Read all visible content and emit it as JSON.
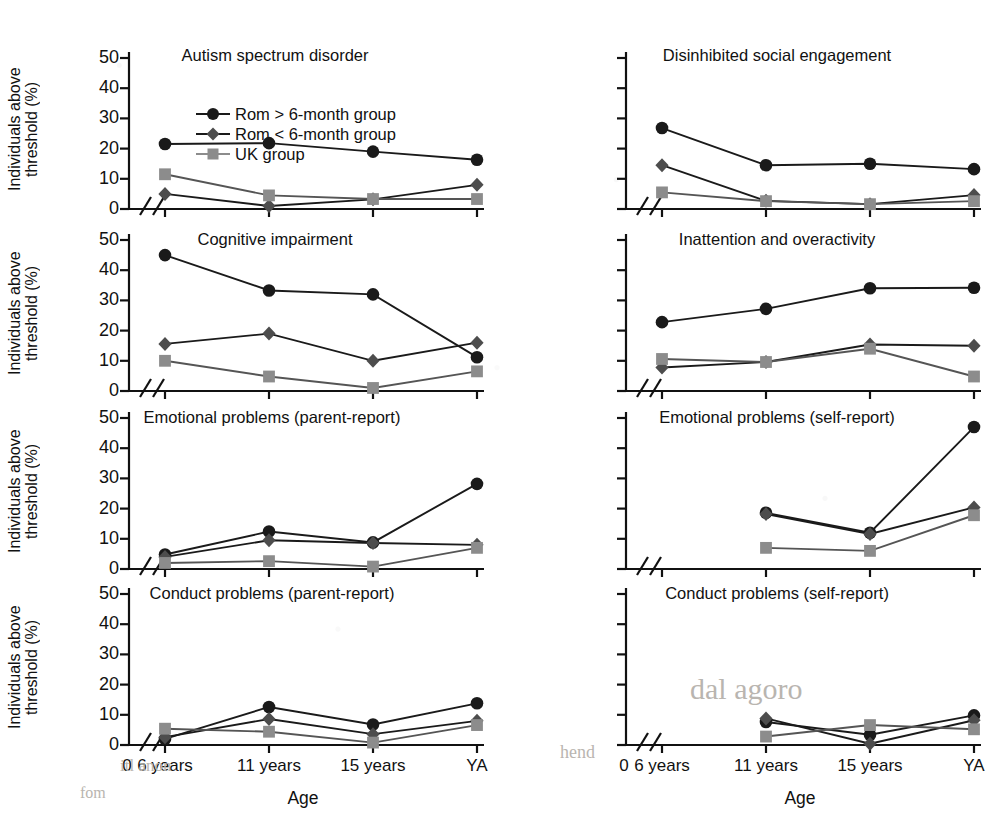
{
  "figure": {
    "x_axis_label": "Age",
    "y_axis_label": "Individuals above\nthreshold (%)",
    "y_axis_label_line1": "Individuals above",
    "y_axis_label_line2": "threshold (%)",
    "y_ticks": [
      "0",
      "10",
      "20",
      "30",
      "40",
      "50"
    ],
    "y_tick_values": [
      0,
      10,
      20,
      30,
      40,
      50
    ],
    "x_origin_label": "0",
    "x_ticks": [
      "6 years",
      "11 years",
      "15 years",
      "YA"
    ],
    "axis_break": true
  },
  "legend": {
    "position": "top-left-panel-inside",
    "entries": [
      {
        "label": "Rom > 6-month group",
        "marker": "circle",
        "color": "#1a1a1a"
      },
      {
        "label": "Rom < 6-month group",
        "marker": "diamond",
        "color": "#4d4d4d"
      },
      {
        "label": "UK group",
        "marker": "square",
        "color": "#8c8c8c"
      }
    ]
  },
  "colors": {
    "rom_over6": "#1a1a1a",
    "rom_under6": "#4d4d4d",
    "uk": "#8c8c8c",
    "axis": "#111111"
  },
  "chart_data": [
    {
      "type": "line",
      "title": "Autism spectrum disorder",
      "xlabel": "Age",
      "ylabel": "Individuals above threshold (%)",
      "categories": [
        "6 years",
        "11 years",
        "15 years",
        "YA"
      ],
      "ylim": [
        0,
        50
      ],
      "grid": false,
      "legend": "inside-top-right",
      "series": [
        {
          "name": "Rom > 6-month group",
          "values": [
            21.5,
            21.8,
            19.0,
            16.3
          ]
        },
        {
          "name": "Rom < 6-month group",
          "values": [
            5.0,
            1.0,
            3.2,
            8.0
          ]
        },
        {
          "name": "UK group",
          "values": [
            11.5,
            4.5,
            3.3,
            3.3
          ]
        }
      ]
    },
    {
      "type": "line",
      "title": "Disinhibited social engagement",
      "xlabel": "Age",
      "ylabel": "Individuals above threshold (%)",
      "categories": [
        "6 years",
        "11 years",
        "15 years",
        "YA"
      ],
      "ylim": [
        0,
        50
      ],
      "grid": false,
      "series": [
        {
          "name": "Rom > 6-month group",
          "values": [
            26.8,
            14.5,
            15.0,
            13.2
          ]
        },
        {
          "name": "Rom < 6-month group",
          "values": [
            14.5,
            2.7,
            1.6,
            4.6
          ]
        },
        {
          "name": "UK group",
          "values": [
            5.5,
            2.6,
            1.6,
            2.6
          ]
        }
      ]
    },
    {
      "type": "line",
      "title": "Cognitive impairment",
      "xlabel": "Age",
      "ylabel": "Individuals above threshold (%)",
      "categories": [
        "6 years",
        "11 years",
        "15 years",
        "YA"
      ],
      "ylim": [
        0,
        50
      ],
      "grid": false,
      "series": [
        {
          "name": "Rom > 6-month group",
          "values": [
            45.0,
            33.3,
            32.0,
            11.2
          ]
        },
        {
          "name": "Rom < 6-month group",
          "values": [
            15.6,
            19.0,
            10.0,
            16.0
          ]
        },
        {
          "name": "UK group",
          "values": [
            10.0,
            4.8,
            1.0,
            6.5
          ]
        }
      ]
    },
    {
      "type": "line",
      "title": "Inattention and overactivity",
      "xlabel": "Age",
      "ylabel": "Individuals above threshold (%)",
      "categories": [
        "6 years",
        "11 years",
        "15 years",
        "YA"
      ],
      "ylim": [
        0,
        50
      ],
      "grid": false,
      "series": [
        {
          "name": "Rom > 6-month group",
          "values": [
            22.8,
            27.2,
            34.0,
            34.2
          ]
        },
        {
          "name": "Rom < 6-month group",
          "values": [
            7.8,
            9.6,
            15.4,
            15.0
          ]
        },
        {
          "name": "UK group",
          "values": [
            10.6,
            9.6,
            14.0,
            4.8
          ]
        }
      ]
    },
    {
      "type": "line",
      "title": "Emotional problems (parent-report)",
      "xlabel": "Age",
      "ylabel": "Individuals above threshold (%)",
      "categories": [
        "6 years",
        "11 years",
        "15 years",
        "YA"
      ],
      "ylim": [
        0,
        50
      ],
      "grid": false,
      "series": [
        {
          "name": "Rom > 6-month group",
          "values": [
            4.8,
            12.4,
            8.8,
            28.2
          ]
        },
        {
          "name": "Rom < 6-month group",
          "values": [
            4.0,
            9.5,
            8.6,
            8.0
          ]
        },
        {
          "name": "UK group",
          "values": [
            2.0,
            2.6,
            0.8,
            7.0
          ]
        }
      ]
    },
    {
      "type": "line",
      "title": "Emotional problems (self-report)",
      "xlabel": "Age",
      "ylabel": "Individuals above threshold (%)",
      "categories": [
        "6 years",
        "11 years",
        "15 years",
        "YA"
      ],
      "ylim": [
        0,
        50
      ],
      "grid": false,
      "series": [
        {
          "name": "Rom > 6-month group",
          "values": [
            null,
            18.6,
            12.0,
            47.0
          ]
        },
        {
          "name": "Rom < 6-month group",
          "values": [
            null,
            18.2,
            11.6,
            20.4
          ]
        },
        {
          "name": "UK group",
          "values": [
            null,
            7.0,
            6.0,
            17.8
          ]
        }
      ]
    },
    {
      "type": "line",
      "title": "Conduct problems (parent-report)",
      "xlabel": "Age",
      "ylabel": "Individuals above threshold (%)",
      "categories": [
        "6 years",
        "11 years",
        "15 years",
        "YA"
      ],
      "ylim": [
        0,
        50
      ],
      "grid": false,
      "series": [
        {
          "name": "Rom > 6-month group",
          "values": [
            2.0,
            12.6,
            6.8,
            13.8
          ]
        },
        {
          "name": "Rom < 6-month group",
          "values": [
            2.6,
            8.6,
            3.6,
            8.0
          ]
        },
        {
          "name": "UK group",
          "values": [
            5.4,
            4.4,
            0.8,
            6.6
          ]
        }
      ]
    },
    {
      "type": "line",
      "title": "Conduct problems (self-report)",
      "xlabel": "Age",
      "ylabel": "Individuals above threshold (%)",
      "categories": [
        "6 years",
        "11 years",
        "15 years",
        "YA"
      ],
      "ylim": [
        0,
        50
      ],
      "grid": false,
      "series": [
        {
          "name": "Rom > 6-month group",
          "values": [
            null,
            7.6,
            3.4,
            9.8
          ]
        },
        {
          "name": "Rom < 6-month group",
          "values": [
            null,
            8.8,
            0.4,
            8.2
          ]
        },
        {
          "name": "UK group",
          "values": [
            null,
            2.8,
            6.6,
            5.2
          ]
        }
      ]
    }
  ],
  "background_text": {
    "items": [
      "dal agoro",
      "hend",
      "itl anon",
      "fom"
    ]
  }
}
